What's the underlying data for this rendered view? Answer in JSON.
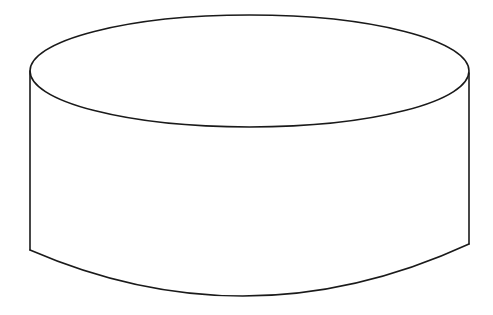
{
  "diagram": {
    "type": "cylinder-line-drawing",
    "colors": {
      "background": "#ffffff",
      "stroke": "#1a1a1a"
    },
    "shapes": {
      "top_ellipse": {
        "cx": 249.5,
        "cy": 71,
        "rx": 219.5,
        "ry": 56
      },
      "left_side": {
        "x": 30,
        "y1": 71,
        "y2": 250
      },
      "right_side": {
        "x": 469,
        "y1": 73,
        "y2": 244
      },
      "bottom_arc": {
        "start": [
          30,
          250
        ],
        "control": [
          249.5,
          345
        ],
        "end": [
          469,
          244
        ]
      }
    }
  }
}
